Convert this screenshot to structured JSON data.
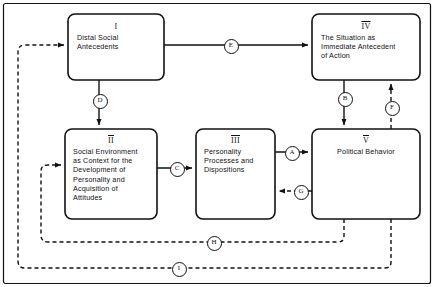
{
  "diagram": {
    "frame": {
      "visible": true,
      "color": "#111111"
    },
    "boxes": [
      {
        "id": "box-1",
        "numeral": "I",
        "numeral_overline": false,
        "text": "Distal Social\nAntecedents",
        "align": "left",
        "x": 68,
        "y": 14,
        "w": 96,
        "h": 66
      },
      {
        "id": "box-4",
        "numeral": "IV",
        "numeral_overline": true,
        "text": "The Situation as\nImmediate Antecedent\nof Action",
        "align": "left",
        "x": 312,
        "y": 14,
        "w": 108,
        "h": 66
      },
      {
        "id": "box-2",
        "numeral": "II",
        "numeral_overline": true,
        "text": "Social Environment\nas Context for the\nDevelopment of\nPersonality and\nAcquisition of\nAttitudes",
        "align": "left",
        "x": 65,
        "y": 129,
        "w": 92,
        "h": 90
      },
      {
        "id": "box-3",
        "numeral": "III",
        "numeral_overline": true,
        "text": "Personality\nProcesses and\nDispositions",
        "align": "left",
        "x": 196,
        "y": 129,
        "w": 79,
        "h": 90
      },
      {
        "id": "box-5",
        "numeral": "V",
        "numeral_overline": true,
        "text": "Political Behavior",
        "align": "center",
        "x": 312,
        "y": 129,
        "w": 108,
        "h": 90
      }
    ],
    "edges": [
      {
        "id": "edge-A",
        "letter": "A",
        "style": "solid",
        "lx": 291,
        "ly": 152,
        "from": "box-3",
        "to": "box-5"
      },
      {
        "id": "edge-B",
        "letter": "B",
        "style": "solid",
        "lx": 344,
        "ly": 98,
        "from": "box-4",
        "to": "box-5"
      },
      {
        "id": "edge-C",
        "letter": "C",
        "style": "solid",
        "lx": 176,
        "ly": 168,
        "from": "box-2",
        "to": "box-3"
      },
      {
        "id": "edge-D",
        "letter": "D",
        "style": "solid",
        "lx": 99,
        "ly": 100,
        "from": "box-1",
        "to": "box-2"
      },
      {
        "id": "edge-E",
        "letter": "E",
        "style": "solid",
        "lx": 230,
        "ly": 45,
        "from": "box-1",
        "to": "box-4"
      },
      {
        "id": "edge-F",
        "letter": "F",
        "style": "dashed",
        "lx": 391,
        "ly": 107,
        "from": "box-5",
        "to": "box-4"
      },
      {
        "id": "edge-G",
        "letter": "G",
        "style": "dashed",
        "lx": 300,
        "ly": 191,
        "from": "box-5",
        "to": "box-3"
      },
      {
        "id": "edge-H",
        "letter": "H",
        "style": "dashed",
        "lx": 213,
        "ly": 242,
        "from": "box-5",
        "to": "box-2"
      },
      {
        "id": "edge-I",
        "letter": "I",
        "style": "dashed",
        "lx": 178,
        "ly": 268,
        "from": "box-5",
        "to": "box-1"
      }
    ],
    "colors": {
      "line": "#111111",
      "text": "#111111",
      "background": "#ffffff"
    }
  }
}
